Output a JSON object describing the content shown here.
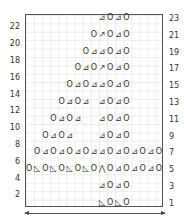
{
  "chart": {
    "columns": 17,
    "rows_total": 23,
    "grid_color": "#ececec",
    "border_color": "#555555",
    "symbol_legend": {
      "O": "yarn over",
      "⊿": "k2tog (right-leaning decrease)",
      "◺": "ssk (left-leaning decrease)",
      "⋀": "centered double decrease",
      "↗": "sl1-k2tog-psso style decrease"
    },
    "rows": [
      {
        "row": 23,
        "start_col": 10,
        "symbols": [
          "⊿",
          "O",
          "⊿",
          "O"
        ]
      },
      {
        "row": 21,
        "start_col": 9,
        "symbols": [
          "O",
          "↗",
          "O",
          "⊿",
          "O"
        ]
      },
      {
        "row": 19,
        "start_col": 8,
        "symbols": [
          "O",
          "⊿",
          "⊿",
          "O",
          "⊿",
          "O"
        ]
      },
      {
        "row": 17,
        "start_col": 7,
        "symbols": [
          "O",
          "⊿",
          "O",
          "↗",
          "O",
          "⊿",
          "O"
        ]
      },
      {
        "row": 15,
        "start_col": 6,
        "symbols": [
          "O",
          "⊿",
          "O",
          "⊿",
          "⊿",
          "O",
          "⊿",
          "O"
        ]
      },
      {
        "row": 13,
        "start_col": 5,
        "symbols": [
          "O",
          "⊿",
          "O",
          "⊿",
          "",
          "⊿",
          "O",
          "⊿",
          "O"
        ]
      },
      {
        "row": 11,
        "start_col": 4,
        "symbols": [
          "O",
          "⊿",
          "O",
          "⊿",
          "",
          "",
          "⊿",
          "O",
          "⊿",
          "O"
        ]
      },
      {
        "row": 9,
        "start_col": 3,
        "symbols": [
          "O",
          "⊿",
          "O",
          "⊿",
          "",
          "",
          "",
          "⊿",
          "O",
          "⊿",
          "O"
        ]
      },
      {
        "row": 7,
        "start_col": 2,
        "symbols": [
          "O",
          "⊿",
          "O",
          "⊿",
          "O",
          "⊿",
          "O",
          "⊿",
          "⊿",
          "O",
          "⊿",
          "O",
          "⊿",
          "O",
          "⊿",
          "O"
        ]
      },
      {
        "row": 5,
        "start_col": 1,
        "symbols": [
          "O",
          "◺",
          "O",
          "◺",
          "O",
          "◺",
          "O",
          "◺",
          "O",
          "⋀",
          "O",
          "⊿",
          "O",
          "⊿",
          "O",
          "⊿",
          "O"
        ]
      },
      {
        "row": 3,
        "start_col": 10,
        "symbols": [
          "⊿",
          "O",
          "⊿",
          "O"
        ]
      },
      {
        "row": 1,
        "start_col": 10,
        "symbols": [
          "◺",
          "O",
          "◺",
          "O"
        ]
      }
    ],
    "left_labels": [
      "22",
      "20",
      "18",
      "16",
      "14",
      "12",
      "10",
      "8",
      "6",
      "4",
      "2"
    ],
    "right_labels": [
      "23",
      "21",
      "19",
      "17",
      "15",
      "13",
      "11",
      "9",
      "7",
      "5",
      "3",
      "1"
    ],
    "repeat_arrow": "double-headed arrow under chart"
  }
}
